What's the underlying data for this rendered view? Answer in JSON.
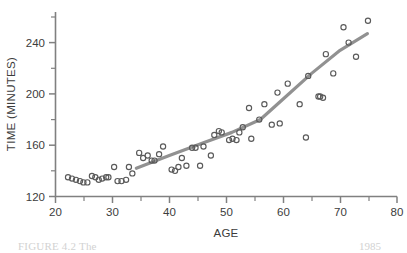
{
  "figure": {
    "caption_left": "FIGURE 4.2  The",
    "caption_right": "1985"
  },
  "axes": {
    "x_title": "AGE",
    "y_title": "TIME (MINUTES)",
    "x_ticks": [
      "20",
      "30",
      "40",
      "50",
      "60",
      "70",
      "80"
    ],
    "y_ticks": [
      "120",
      "160",
      "200",
      "240"
    ]
  },
  "chart_data": {
    "type": "scatter",
    "title": "",
    "xlabel": "AGE",
    "ylabel": "TIME (MINUTES)",
    "xlim": [
      20,
      80
    ],
    "ylim": [
      120,
      262
    ],
    "grid": false,
    "legend": "none",
    "x_tick_values": [
      20,
      30,
      40,
      50,
      60,
      70,
      80
    ],
    "x_minor_tick_values": [
      25,
      35,
      45,
      55,
      65,
      75
    ],
    "y_tick_values": [
      120,
      160,
      200,
      240
    ],
    "y_minor_tick_values": [
      140,
      180,
      220,
      260
    ],
    "marker_style": "open-circle",
    "marker_color": "#5a5a5a",
    "trend_color": "#919191",
    "points": [
      [
        22.2,
        135
      ],
      [
        22.9,
        134
      ],
      [
        23.6,
        133
      ],
      [
        24.3,
        132
      ],
      [
        24.9,
        131
      ],
      [
        25.6,
        131
      ],
      [
        26.4,
        136
      ],
      [
        27.0,
        135
      ],
      [
        27.6,
        133
      ],
      [
        28.2,
        134
      ],
      [
        28.9,
        135
      ],
      [
        29.3,
        135
      ],
      [
        30.3,
        143
      ],
      [
        30.9,
        132
      ],
      [
        31.6,
        132
      ],
      [
        32.4,
        133
      ],
      [
        32.9,
        143
      ],
      [
        33.5,
        138
      ],
      [
        34.7,
        154
      ],
      [
        35.4,
        150
      ],
      [
        36.2,
        152
      ],
      [
        36.9,
        148
      ],
      [
        37.4,
        148
      ],
      [
        38.2,
        153
      ],
      [
        38.9,
        159
      ],
      [
        40.4,
        141
      ],
      [
        41.0,
        140
      ],
      [
        41.6,
        143
      ],
      [
        42.2,
        150
      ],
      [
        43.0,
        144
      ],
      [
        44.0,
        158
      ],
      [
        44.6,
        158
      ],
      [
        45.4,
        144
      ],
      [
        46.0,
        159
      ],
      [
        47.3,
        152
      ],
      [
        47.9,
        168
      ],
      [
        48.7,
        171
      ],
      [
        49.2,
        170
      ],
      [
        50.5,
        164
      ],
      [
        51.1,
        165
      ],
      [
        51.8,
        164
      ],
      [
        52.3,
        170
      ],
      [
        52.9,
        174
      ],
      [
        54.0,
        189
      ],
      [
        54.4,
        165
      ],
      [
        55.8,
        180
      ],
      [
        56.7,
        192
      ],
      [
        58.0,
        176
      ],
      [
        59.0,
        201
      ],
      [
        59.4,
        177
      ],
      [
        60.8,
        208
      ],
      [
        62.9,
        192
      ],
      [
        64.0,
        166
      ],
      [
        64.4,
        214
      ],
      [
        66.2,
        198
      ],
      [
        66.5,
        198
      ],
      [
        67.0,
        197
      ],
      [
        67.5,
        231
      ],
      [
        68.8,
        216
      ],
      [
        70.6,
        252
      ],
      [
        71.5,
        240
      ],
      [
        72.8,
        229
      ],
      [
        74.9,
        257
      ]
    ],
    "trend_line": [
      [
        34.2,
        142
      ],
      [
        40.0,
        152
      ],
      [
        46.0,
        162
      ],
      [
        51.0,
        170
      ],
      [
        56.0,
        180
      ],
      [
        60.0,
        196
      ],
      [
        65.0,
        216
      ],
      [
        70.0,
        234
      ],
      [
        74.8,
        247
      ]
    ],
    "n_points": 63
  }
}
